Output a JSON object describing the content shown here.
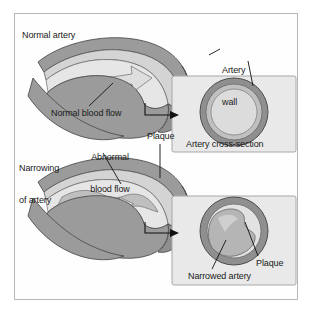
{
  "figure": {
    "title_visible": false,
    "background_color": "#ffffff",
    "frame_border_color": "#b6b6b6"
  },
  "labels": {
    "normal_artery": "Normal artery",
    "artery_wall_line1": "Artery",
    "artery_wall_line2": "wall",
    "normal_blood_flow": "Normal blood flow",
    "narrowing_line1": "Narrowing",
    "narrowing_line2": "of artery",
    "abnormal_flow_line1": "Abnormal",
    "abnormal_flow_line2": "blood flow",
    "plaque_top": "Plaque",
    "artery_cross_section": "Artery cross-section",
    "plaque_bottom": "Plaque",
    "narrowed_artery": "Narrowed artery"
  },
  "panels": {
    "top_cross_section_caption": "Artery cross-section",
    "panel_fill": "#e8e8e8",
    "panel_border": "#a8a8a8"
  },
  "colors": {
    "artery_wall_dark": "#8d8d8d",
    "artery_wall_mid": "#a3a3a3",
    "artery_inner_light": "#d2d2d2",
    "lumen_light": "#e2e2e2",
    "flow_arrow": "#dcdcdc",
    "plaque_fill": "#bdbdbd",
    "outline": "#4a4a4a",
    "leader_line": "#111111",
    "text": "#1a1a1a"
  },
  "diagram": {
    "type": "medical-illustration",
    "top_row": {
      "name": "normal-artery-row",
      "has_flow_arrow": true,
      "flow_arrow_width": "wide",
      "cross_section": {
        "lumen": "open",
        "plaque_present": false
      }
    },
    "bottom_row": {
      "name": "narrowed-artery-row",
      "has_flow_arrow": true,
      "flow_arrow_width": "narrow",
      "cross_section": {
        "lumen": "restricted",
        "plaque_present": true
      }
    }
  }
}
